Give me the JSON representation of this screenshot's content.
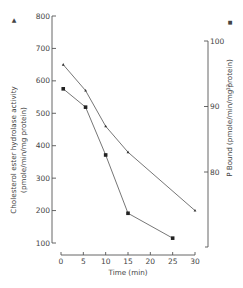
{
  "chart_data": {
    "type": "line",
    "title": "",
    "xlabel": "Time (min)",
    "ylabel_left": "Cholesterol ester hydrolase activity (pmole/min/mg protein)",
    "ylabel_left_line1": "Cholesterol ester hydrolase activity",
    "ylabel_left_line2": "(pmole/min/mg protein)",
    "ylabel_right": "32P Bound (pmole/min/mg protein)",
    "ylabel_right_sup": "32",
    "ylabel_right_text": "P Bound (pmole/min/mg protein)",
    "legend_left_marker": "▲",
    "legend_right_marker": "■",
    "xlim": [
      0,
      30
    ],
    "ylim_left": [
      100,
      800
    ],
    "ylim_right": [
      68,
      100
    ],
    "x_ticks": [
      0,
      5,
      10,
      15,
      20,
      25,
      30
    ],
    "y_ticks_left": [
      100,
      200,
      300,
      400,
      500,
      600,
      700,
      800
    ],
    "y_ticks_right": [
      80,
      90,
      100
    ],
    "grid": false,
    "series": [
      {
        "name": "Cholesterol ester hydrolase activity",
        "axis": "left",
        "marker": "triangle",
        "x": [
          0.5,
          5.5,
          10,
          15,
          30
        ],
        "values": [
          650,
          570,
          460,
          380,
          200
        ]
      },
      {
        "name": "32P Bound",
        "axis": "right",
        "marker": "square",
        "x": [
          0.5,
          5.5,
          10,
          15,
          25
        ],
        "values": [
          92.7,
          89.9,
          82.6,
          73.7,
          69.9
        ]
      }
    ]
  }
}
